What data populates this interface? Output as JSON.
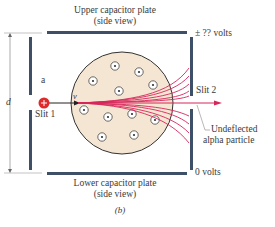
{
  "labels": {
    "upper_plate_line1": "Upper capacitor plate",
    "upper_plate_line2": "(side view)",
    "lower_plate_line1": "Lower capacitor plate",
    "lower_plate_line2": "(side view)",
    "upper_voltage": "± ?? volts",
    "lower_voltage": "0 volts",
    "slit1": "Slit 1",
    "slit2": "Slit 2",
    "region_a": "a",
    "distance_d": "d",
    "velocity": "v",
    "undeflected_line1": "Undeflected",
    "undeflected_line2": "alpha particle",
    "caption": "(b)"
  },
  "colors": {
    "plate": "#3d5068",
    "gold_foil": "#f5e6d3",
    "beam": "#d6265a",
    "particle": "#e02a2a"
  }
}
